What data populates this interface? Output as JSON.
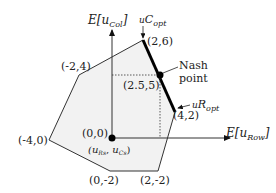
{
  "diagram": {
    "axes": {
      "x_label_prefix": "E[u",
      "x_label_sub": "Row",
      "x_label_suffix": "]",
      "y_label_prefix": "E[u",
      "y_label_sub": "Col",
      "y_label_suffix": "]"
    },
    "vertices": [
      {
        "label": "(2,6)",
        "x": 2,
        "y": 6
      },
      {
        "label": "(4,2)",
        "x": 4,
        "y": 2
      },
      {
        "label": "(2,-2)",
        "x": 2,
        "y": -2
      },
      {
        "label": "(0,-2)",
        "x": 0,
        "y": -2
      },
      {
        "label": "(-4,0)",
        "x": -4,
        "y": 0
      },
      {
        "label": "(-2,4)",
        "x": -2,
        "y": 4
      }
    ],
    "origin": {
      "label": "(0,0)",
      "sub_label_prefix": "(u",
      "sub_label_r": "R",
      "sub_label_c": "C",
      "sub_label_s": "s"
    },
    "nash": {
      "label": "(2.5,5)",
      "annotation_line1": "Nash",
      "annotation_line2": "point"
    },
    "c_opt": {
      "prefix": "u",
      "sub": "C",
      "sub2": "opt"
    },
    "r_opt": {
      "prefix": "u",
      "sub": "R",
      "sub2": "opt"
    },
    "colors": {
      "region_fill": "#f2f2f2",
      "stroke": "#333333",
      "frontier": "#000000"
    }
  }
}
